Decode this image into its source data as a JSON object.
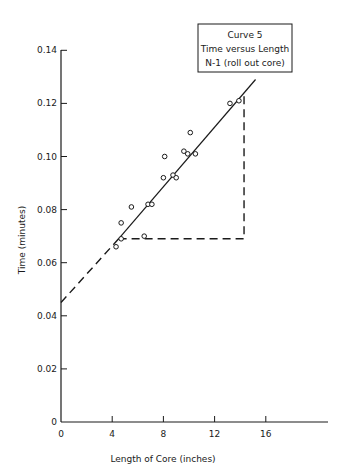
{
  "chart_data": {
    "type": "scatter",
    "title": "Curve 5",
    "legend_lines": [
      "Curve 5",
      "Time versus Length",
      "N-1 (roll out core)"
    ],
    "xlabel": "Length of Core (inches)",
    "ylabel": "Time (minutes)",
    "xlim": [
      0,
      20
    ],
    "ylim": [
      0,
      0.14
    ],
    "x_ticks": [
      0,
      4,
      8,
      12,
      16
    ],
    "x_tick_labels": [
      "0",
      "4",
      "8",
      "12",
      "16"
    ],
    "y_ticks": [
      0,
      0.02,
      0.04,
      0.06,
      0.08,
      0.1,
      0.12,
      0.14
    ],
    "y_tick_labels": [
      "0",
      "0.02",
      "0.04",
      "0.06",
      "0.08",
      "0.10",
      "0.12",
      "0.14"
    ],
    "grid": false,
    "legend_position": "upper right",
    "series": [
      {
        "name": "Observed data",
        "marker": "open-circle",
        "points": [
          [
            4.3,
            0.066
          ],
          [
            4.7,
            0.069
          ],
          [
            4.7,
            0.075
          ],
          [
            5.5,
            0.081
          ],
          [
            6.5,
            0.07
          ],
          [
            6.8,
            0.082
          ],
          [
            7.1,
            0.082
          ],
          [
            8.0,
            0.092
          ],
          [
            8.1,
            0.1
          ],
          [
            8.75,
            0.093
          ],
          [
            9.0,
            0.092
          ],
          [
            9.6,
            0.102
          ],
          [
            9.9,
            0.101
          ],
          [
            10.1,
            0.109
          ],
          [
            10.5,
            0.101
          ],
          [
            13.2,
            0.12
          ],
          [
            13.9,
            0.121
          ]
        ]
      },
      {
        "name": "Fitted line (solid)",
        "style": "solid",
        "points": [
          [
            4.5,
            0.069
          ],
          [
            15.2,
            0.129
          ]
        ]
      },
      {
        "name": "Fitted line extrapolation (dashed)",
        "style": "dashed",
        "points": [
          [
            0,
            0.045
          ],
          [
            4.5,
            0.069
          ]
        ]
      },
      {
        "name": "Slope triangle (dashed)",
        "style": "dashed",
        "points": [
          [
            4.5,
            0.069
          ],
          [
            14.3,
            0.069
          ],
          [
            14.3,
            0.124
          ]
        ]
      }
    ]
  }
}
